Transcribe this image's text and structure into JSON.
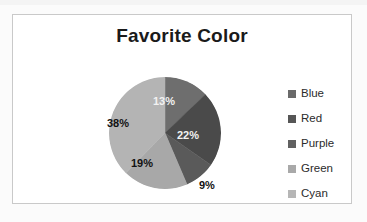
{
  "chart_data": {
    "type": "pie",
    "title": "Favorite Color",
    "categories": [
      "Blue",
      "Red",
      "Purple",
      "Green",
      "Cyan"
    ],
    "values": [
      13,
      22,
      9,
      19,
      38
    ],
    "value_labels": [
      "13%",
      "22%",
      "9%",
      "19%",
      "38%"
    ],
    "units": "percent",
    "legend_position": "right",
    "grid": false,
    "xlabel": "",
    "ylabel": "",
    "slice_colors": [
      "#6e6e6e",
      "#4a4a4a",
      "#5a5a5a",
      "#a8a8a8",
      "#b4b4b4"
    ],
    "legend_swatch_colors": [
      "#6a6a6a",
      "#565656",
      "#616161",
      "#a9a9a9",
      "#b6b6b6"
    ],
    "label_placement": [
      "inside",
      "inside",
      "outside",
      "inside",
      "inside"
    ],
    "start_angle_deg": 0,
    "direction": "clockwise"
  },
  "chart": {
    "title": "Favorite Color",
    "frame_color": "#c9c9c9",
    "background": "#ffffff"
  },
  "legend": {
    "items": [
      {
        "label": "Blue",
        "swatch": "#6a6a6a"
      },
      {
        "label": "Red",
        "swatch": "#565656"
      },
      {
        "label": "Purple",
        "swatch": "#616161"
      },
      {
        "label": "Green",
        "swatch": "#a9a9a9"
      },
      {
        "label": "Cyan",
        "swatch": "#b6b6b6"
      }
    ]
  },
  "labels": {
    "blue": "13%",
    "red": "22%",
    "purple": "9%",
    "green": "19%",
    "cyan": "38%"
  }
}
